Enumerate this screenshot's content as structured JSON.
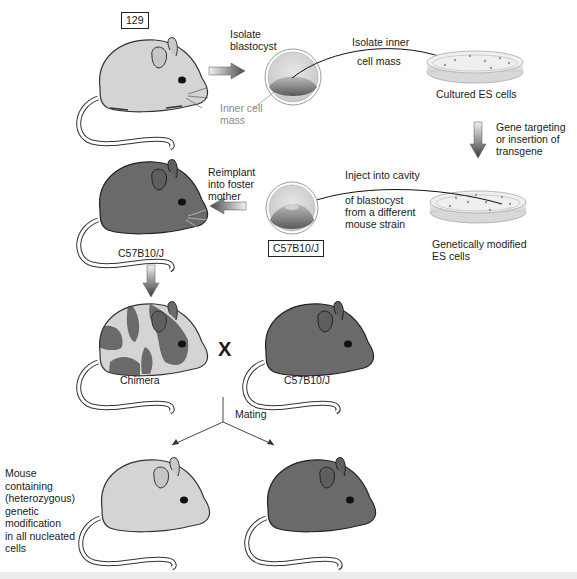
{
  "diagram": {
    "colors": {
      "light_mouse": "#d4d4d4",
      "dark_mouse": "#6a6a6a",
      "outline": "#333333",
      "arrow_dark": "#555555",
      "arrow_light": "#eeeeee",
      "grey_label": "#8a8a8a"
    },
    "row1": {
      "strain_label": "129",
      "step1_label_line1": "Isolate",
      "step1_label_line2": "blastocyst",
      "inner_cell_label_line1": "Inner cell",
      "inner_cell_label_line2": "mass",
      "step2_label_line1": "Isolate inner",
      "step2_label_line2": "cell mass",
      "dish_label": "Cultured ES cells"
    },
    "row2": {
      "gene_step_line1": "Gene targeting",
      "gene_step_line2": "or insertion of",
      "gene_step_line3": "transgene",
      "inject_line1": "Inject into cavity",
      "inject_line2": "of blastocyst",
      "inject_line3": "from a different",
      "inject_line4": "mouse strain",
      "dish_label_line1": "Genetically modified",
      "dish_label_line2": "ES cells",
      "blastocyst_strain": "C57B10/J",
      "reimplant_line1": "Reimplant",
      "reimplant_line2": "into foster",
      "reimplant_line3": "mother",
      "foster_mouse_label": "C57B10/J"
    },
    "row3": {
      "chimera_label": "Chimera",
      "cross_symbol": "X",
      "mate_label": "C57B10/J",
      "mating_label": "Mating"
    },
    "row4": {
      "offspring_label_lines": [
        "Mouse",
        "containing",
        "(heterozygous)",
        "genetic",
        "modification",
        "in all nucleated",
        "cells"
      ]
    }
  }
}
